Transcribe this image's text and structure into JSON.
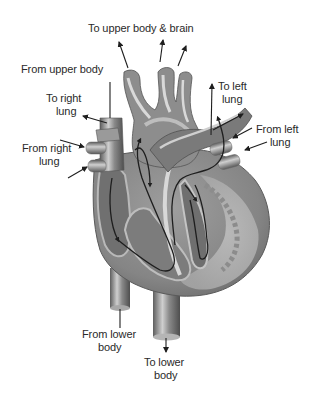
{
  "diagram": {
    "type": "anatomical-illustration",
    "colors": {
      "background": "#ffffff",
      "tissue_dark": "#6e6e6e",
      "tissue_mid": "#9a9a9a",
      "tissue_light": "#c9c9c9",
      "highlight": "#e8e8e8",
      "flow_line": "#1e1e1e",
      "label_text": "#2a2a2a"
    },
    "labels": {
      "to_upper_body_brain": "To upper body & brain",
      "from_upper_body": "From upper body",
      "to_right_lung_1": "To right",
      "to_right_lung_2": "lung",
      "from_right_lung_1": "From right",
      "from_right_lung_2": "lung",
      "to_left_lung_1": "To left",
      "to_left_lung_2": "lung",
      "from_left_lung_1": "From left",
      "from_left_lung_2": "lung",
      "from_lower_body_1": "From lower",
      "from_lower_body_2": "body",
      "to_lower_body_1": "To lower",
      "to_lower_body_2": "body"
    },
    "arrows": [
      {
        "name": "to-upper-body-arrow-1",
        "direction": "out"
      },
      {
        "name": "to-upper-body-arrow-2",
        "direction": "out"
      },
      {
        "name": "to-upper-body-arrow-3",
        "direction": "out"
      },
      {
        "name": "from-upper-body-leader",
        "direction": "in"
      },
      {
        "name": "to-right-lung-arrow",
        "direction": "out"
      },
      {
        "name": "from-right-lung-arrow-1",
        "direction": "in"
      },
      {
        "name": "from-right-lung-arrow-2",
        "direction": "in"
      },
      {
        "name": "to-left-lung-arrow-1",
        "direction": "out"
      },
      {
        "name": "to-left-lung-arrow-2",
        "direction": "out"
      },
      {
        "name": "from-left-lung-arrow-1",
        "direction": "in"
      },
      {
        "name": "from-left-lung-arrow-2",
        "direction": "in"
      },
      {
        "name": "from-lower-body-leader",
        "direction": "in"
      },
      {
        "name": "to-lower-body-arrow",
        "direction": "out"
      }
    ]
  }
}
